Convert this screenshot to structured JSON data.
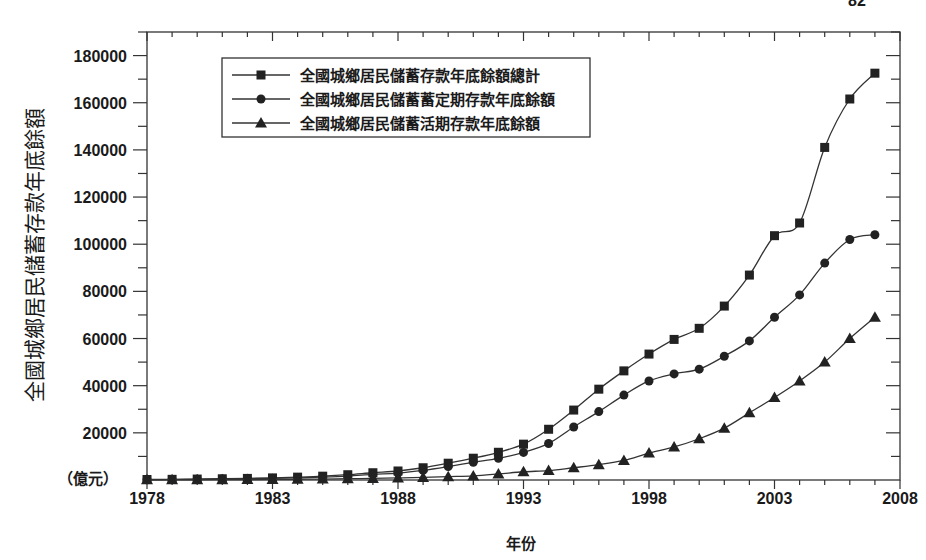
{
  "page_number": "82",
  "chart_data": {
    "type": "line",
    "title": "",
    "xlabel": "年份",
    "ylabel": "全國城鄉居民儲蓄存款年底餘額",
    "y_unit_label": "（億元）",
    "xlim": [
      1978,
      2008
    ],
    "ylim": [
      0,
      190000
    ],
    "x_ticks": [
      1978,
      1983,
      1988,
      1993,
      1998,
      2003,
      2008
    ],
    "y_ticks": [
      20000,
      40000,
      60000,
      80000,
      100000,
      120000,
      140000,
      160000,
      180000
    ],
    "grid": false,
    "legend_position": "upper-left",
    "x": [
      1978,
      1979,
      1980,
      1981,
      1982,
      1983,
      1984,
      1985,
      1986,
      1987,
      1988,
      1989,
      1990,
      1991,
      1992,
      1993,
      1994,
      1995,
      1996,
      1997,
      1998,
      1999,
      2000,
      2001,
      2002,
      2003,
      2004,
      2005,
      2006,
      2007
    ],
    "series": [
      {
        "name": "全國城鄉居民儲蓄存款年底餘額總計",
        "marker": "square",
        "values": [
          211,
          281,
          400,
          524,
          675,
          893,
          1215,
          1623,
          2239,
          3081,
          3822,
          5196,
          7120,
          9242,
          11759,
          15204,
          21519,
          29662,
          38521,
          46280,
          53408,
          59622,
          64332,
          73762,
          86911,
          103618,
          109000,
          141051,
          161587,
          172534
        ]
      },
      {
        "name": "全國城鄉居民儲蓄蓄定期存款年底餘額",
        "marker": "circle",
        "values": [
          128,
          160,
          305,
          396,
          500,
          660,
          890,
          1220,
          1680,
          2400,
          2950,
          4100,
          5700,
          7500,
          9200,
          11700,
          15500,
          22500,
          29000,
          36000,
          42000,
          45000,
          47000,
          52500,
          59000,
          69000,
          78500,
          92000,
          102000,
          104000
        ]
      },
      {
        "name": "全國城鄉居民儲蓄活期存款年底餘額",
        "marker": "triangle",
        "values": [
          83,
          121,
          95,
          128,
          175,
          233,
          325,
          403,
          559,
          681,
          872,
          1096,
          1420,
          1742,
          2559,
          3500,
          4000,
          5200,
          6500,
          8300,
          11400,
          14000,
          17500,
          22000,
          28500,
          35000,
          42000,
          50000,
          60000,
          69000
        ]
      }
    ]
  }
}
